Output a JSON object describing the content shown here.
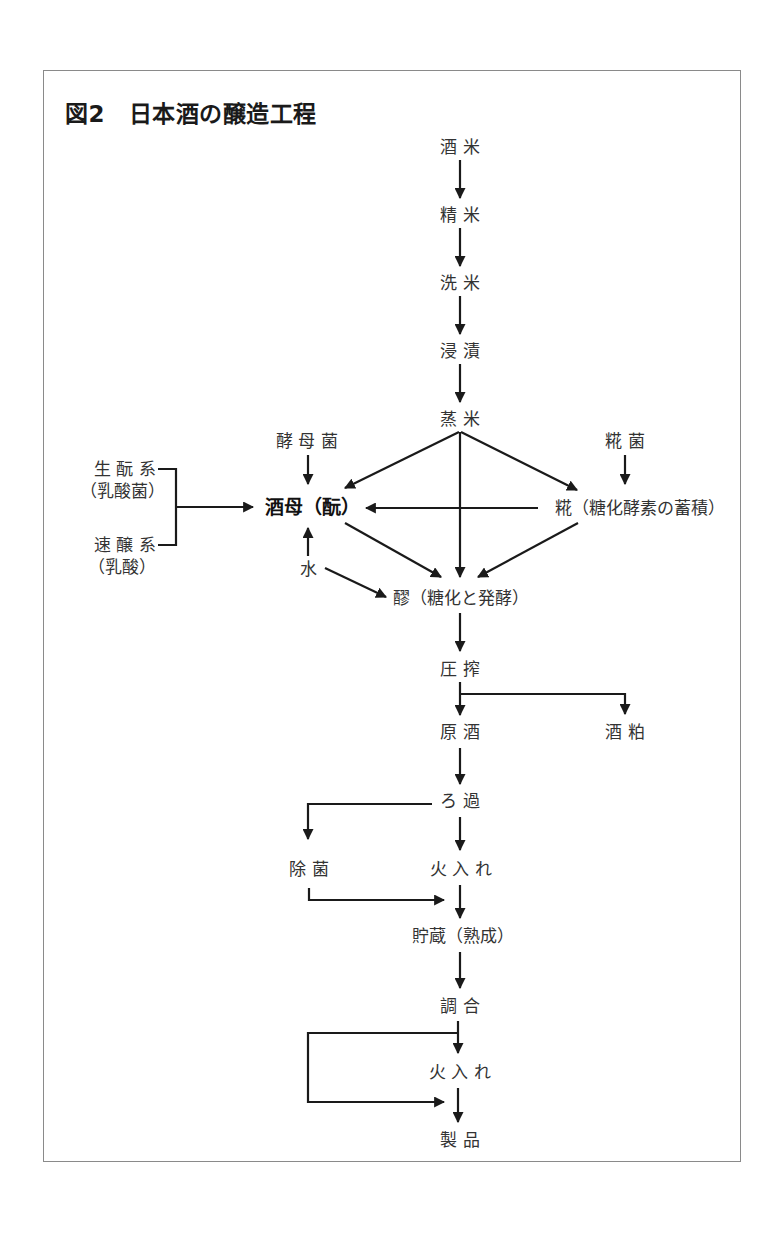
{
  "title": "図2　日本酒の醸造工程",
  "nodes": {
    "sakamai": "酒 米",
    "seimai": "精 米",
    "senmai": "洗 米",
    "shinseki": "浸 漬",
    "mushimai": "蒸 米",
    "koubokin": "酵 母 菌",
    "koujikin": "糀 菌",
    "kimoto": "生 酛 系",
    "kimoto_sub": "（乳酸菌）",
    "sokujo": "速 醸 系",
    "sokujo_sub": "（乳酸）",
    "shubo": "酒母（酛）",
    "kouji": "糀（糖化酵素の蓄積）",
    "mizu": "水",
    "moromi": "醪（糖化と発酵）",
    "assaku": "圧 搾",
    "genshu": "原 酒",
    "sakekasu": "酒 粕",
    "roka": "ろ 過",
    "jokin": "除 菌",
    "hiire1": "火 入 れ",
    "chozo": "貯蔵（熟成）",
    "chougou": "調 合",
    "hiire2": "火 入 れ",
    "seihin": "製 品"
  },
  "colors": {
    "line": "#1a1a1a",
    "text": "#333333",
    "frame": "#8a8a8a"
  }
}
